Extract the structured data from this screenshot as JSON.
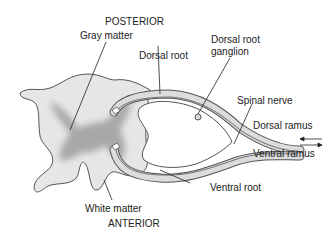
{
  "diagram": {
    "labels": {
      "posterior": "POSTERIOR",
      "anterior": "ANTERIOR",
      "gray_matter": "Gray matter",
      "white_matter": "White matter",
      "dorsal_root": "Dorsal root",
      "dorsal_root_ganglion_line1": "Dorsal root",
      "dorsal_root_ganglion_line2": "ganglion",
      "spinal_nerve": "Spinal nerve",
      "dorsal_ramus": "Dorsal ramus",
      "ventral_ramus": "Ventral ramus",
      "ventral_root": "Ventral root"
    },
    "colors": {
      "white_matter_fill": "#e6e6e6",
      "gray_matter_fill": "#a8a8a8",
      "outline": "#555555",
      "nerve_fill": "#dcdcdc",
      "text": "#222222"
    }
  }
}
